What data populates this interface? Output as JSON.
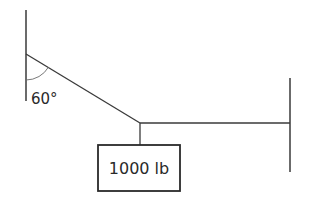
{
  "diagram": {
    "angle_label": "60°",
    "angle_value_deg": 60,
    "weight_label": "1000 lb",
    "components": {
      "left_support": "vertical wall",
      "right_support": "vertical wall",
      "inclined_cable": "cable from left wall to junction, 60° from wall",
      "horizontal_cable": "cable from junction to right wall",
      "hanging_cable": "vertical cable from junction to weight",
      "weight": "box"
    },
    "colors": {
      "line": "#3a3a3a",
      "background": "#ffffff"
    }
  }
}
